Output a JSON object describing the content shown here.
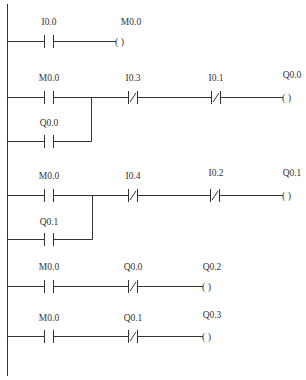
{
  "diagram": {
    "type": "ladder-logic",
    "rungs": [
      {
        "elements": [
          {
            "kind": "NO-contact",
            "label": "I0.0"
          },
          {
            "kind": "coil",
            "label": "M0.0"
          }
        ]
      },
      {
        "elements": [
          {
            "kind": "NO-contact",
            "label": "M0.0"
          },
          {
            "kind": "NC-contact",
            "label": "I0.3"
          },
          {
            "kind": "NC-contact",
            "label": "I0.1"
          },
          {
            "kind": "coil",
            "label": "Q0.0"
          }
        ],
        "parallel_branch": {
          "kind": "NO-contact",
          "label": "Q0.0"
        }
      },
      {
        "elements": [
          {
            "kind": "NO-contact",
            "label": "M0.0"
          },
          {
            "kind": "NC-contact",
            "label": "I0.4"
          },
          {
            "kind": "NC-contact",
            "label": "I0.2"
          },
          {
            "kind": "coil",
            "label": "Q0.1"
          }
        ],
        "parallel_branch": {
          "kind": "NO-contact",
          "label": "Q0.1"
        }
      },
      {
        "elements": [
          {
            "kind": "NO-contact",
            "label": "M0.0"
          },
          {
            "kind": "NC-contact",
            "label": "Q0.0"
          },
          {
            "kind": "coil",
            "label": "Q0.2"
          }
        ]
      },
      {
        "elements": [
          {
            "kind": "NO-contact",
            "label": "M0.0"
          },
          {
            "kind": "NC-contact",
            "label": "Q0.1"
          },
          {
            "kind": "coil",
            "label": "Q0.3"
          }
        ]
      }
    ],
    "coil_glyph": "(   )"
  }
}
